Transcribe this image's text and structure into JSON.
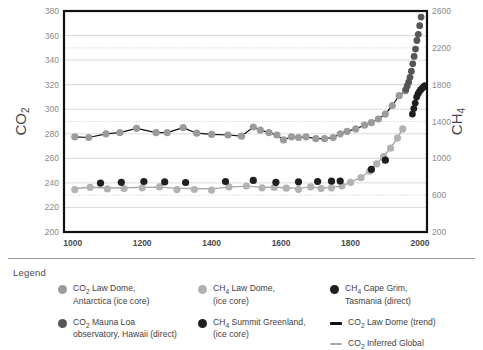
{
  "chart_data": {
    "type": "scatter",
    "title": "",
    "xlabel": "",
    "ylabel": "CO2",
    "y2label": "CH4",
    "xlim": [
      975,
      2020
    ],
    "ylim": [
      200,
      380
    ],
    "y2lim": [
      200,
      2600
    ],
    "grid": true,
    "legend_position": "below",
    "x_ticks": [
      1000,
      1200,
      1400,
      1600,
      1800,
      2000
    ],
    "y_ticks": [
      200,
      220,
      240,
      260,
      280,
      300,
      320,
      340,
      360,
      380
    ],
    "y2_ticks": [
      200,
      600,
      1000,
      1400,
      1800,
      2200,
      2600
    ],
    "series": [
      {
        "name": "CO2 Law Dome, Antarctica (ice core)",
        "axis": "left",
        "color": "#9b9b9b",
        "marker": "circle",
        "x": [
          1006,
          1046,
          1096,
          1136,
          1184,
          1240,
          1272,
          1318,
          1357,
          1400,
          1447,
          1486,
          1520,
          1540,
          1565,
          1588,
          1607,
          1630,
          1650,
          1672,
          1700,
          1725,
          1750,
          1770,
          1790,
          1815,
          1840,
          1860,
          1880,
          1900,
          1920,
          1940,
          1958
        ],
        "y": [
          277.5,
          277.0,
          280.0,
          281.0,
          284.5,
          281.0,
          281.0,
          285.0,
          280.5,
          279.5,
          279.0,
          278.0,
          285.5,
          283.0,
          281.0,
          279.0,
          275.0,
          277.5,
          277.0,
          277.5,
          276.0,
          276.0,
          277.0,
          280.0,
          282.0,
          284.0,
          287.0,
          289.0,
          292.0,
          296.0,
          303.0,
          311.0,
          315.0
        ]
      },
      {
        "name": "CO2 Mauna Loa observatory, Hawaii (direct)",
        "axis": "left",
        "color": "#565656",
        "marker": "circle",
        "x": [
          1959,
          1963,
          1967,
          1971,
          1975,
          1979,
          1983,
          1987,
          1991,
          1995,
          1999,
          2003,
          2007,
          2011,
          2014
        ],
        "y": [
          316,
          319,
          322,
          326,
          331,
          337,
          343,
          349,
          356,
          361,
          368,
          375,
          384,
          392,
          399
        ]
      },
      {
        "name": "CH4 Law Dome, (ice core)",
        "axis": "right",
        "color": "#b2b2b2",
        "marker": "circle",
        "x": [
          1006,
          1050,
          1100,
          1148,
          1200,
          1250,
          1300,
          1350,
          1400,
          1450,
          1500,
          1545,
          1580,
          1615,
          1650,
          1685,
          1715,
          1745,
          1775,
          1800,
          1830,
          1855,
          1875,
          1895,
          1915,
          1935,
          1950
        ],
        "y": [
          660,
          685,
          668,
          672,
          680,
          690,
          660,
          662,
          655,
          690,
          700,
          680,
          684,
          676,
          664,
          690,
          672,
          680,
          700,
          740,
          790,
          860,
          940,
          1020,
          1110,
          1220,
          1320
        ]
      },
      {
        "name": "CH4 Summit Greenland, (ice core)",
        "axis": "right",
        "color": "#1f1f1f",
        "marker": "circle",
        "x": [
          1080,
          1140,
          1205,
          1265,
          1325,
          1440,
          1520,
          1585,
          1650,
          1705,
          1745,
          1770,
          1860,
          1900
        ],
        "y": [
          730,
          740,
          748,
          744,
          738,
          748,
          760,
          740,
          745,
          748,
          752,
          754,
          880,
          980
        ]
      },
      {
        "name": "CH4 Cape Grim, Tasmania (direct)",
        "axis": "right",
        "color": "#1f1f1f",
        "marker": "circle",
        "x": [
          1978,
          1982,
          1986,
          1990,
          1994,
          1998,
          2002,
          2006,
          2010,
          2014
        ],
        "y": [
          1480,
          1540,
          1600,
          1665,
          1700,
          1725,
          1745,
          1760,
          1775,
          1790
        ]
      }
    ],
    "trend_lines": [
      {
        "name": "CO2 Law Dome (trend)",
        "axis": "left",
        "color": "#111111",
        "width": 1.2,
        "x": [
          1006,
          1046,
          1096,
          1136,
          1184,
          1240,
          1272,
          1318,
          1357,
          1400,
          1447,
          1486,
          1520,
          1540,
          1565,
          1588,
          1607,
          1630,
          1650,
          1672,
          1700,
          1725,
          1750,
          1770,
          1790,
          1815,
          1840,
          1860,
          1880,
          1900,
          1920,
          1940,
          1958
        ],
        "y": [
          277.5,
          277.0,
          280.0,
          281.0,
          284.5,
          281.0,
          281.0,
          285.0,
          280.5,
          279.5,
          279.0,
          278.0,
          285.5,
          283.0,
          281.0,
          279.0,
          275.0,
          277.5,
          277.0,
          277.5,
          276.0,
          276.0,
          277.0,
          280.0,
          282.0,
          284.0,
          287.0,
          289.0,
          292.0,
          296.0,
          303.0,
          311.0,
          315.0
        ]
      },
      {
        "name": "CO2 Inferred Global",
        "axis": "right",
        "color": "#a8a8a8",
        "width": 1.4,
        "x": [
          1006,
          1050,
          1100,
          1148,
          1200,
          1250,
          1300,
          1350,
          1400,
          1450,
          1500,
          1545,
          1580,
          1615,
          1650,
          1685,
          1715,
          1745,
          1775,
          1800,
          1830,
          1855,
          1875,
          1895,
          1915,
          1935,
          1950
        ],
        "y": [
          672,
          686,
          678,
          680,
          684,
          688,
          674,
          672,
          668,
          688,
          698,
          684,
          686,
          680,
          674,
          690,
          678,
          684,
          700,
          742,
          792,
          862,
          942,
          1022,
          1112,
          1222,
          1322
        ]
      }
    ]
  },
  "legend": {
    "title": "Legend",
    "columns": [
      [
        {
          "swatch": "dot",
          "color": "#9b9b9b",
          "label": "CO2 Law Dome,\nAntarctica (ice core)",
          "name": "legend-co2-law-dome"
        },
        {
          "swatch": "dot",
          "color": "#565656",
          "label": "CO2 Mauna Loa\nobservatory, Hawaii (direct)",
          "name": "legend-co2-mauna-loa"
        }
      ],
      [
        {
          "swatch": "dot",
          "color": "#b2b2b2",
          "label": "CH4 Law Dome,\n(ice core)",
          "name": "legend-ch4-law-dome"
        },
        {
          "swatch": "dot",
          "color": "#1f1f1f",
          "label": "CH4 Summit Greenland,\n(ice core)",
          "name": "legend-ch4-summit-greenland"
        }
      ],
      [
        {
          "swatch": "dot",
          "color": "#1f1f1f",
          "label": "CH4 Cape Grim,\nTasmania (direct)",
          "name": "legend-ch4-cape-grim"
        },
        {
          "swatch": "line",
          "color": "#111111",
          "label": "CO2 Law Dome (trend)",
          "name": "legend-co2-law-dome-trend"
        },
        {
          "swatch": "line-thin",
          "color": "#a8a8a8",
          "label": "CO2 Inferred Global",
          "name": "legend-co2-inferred-global"
        }
      ]
    ]
  },
  "colors": {
    "axis": "#111111",
    "gridline_left": "#d8d8d8",
    "gridline_right": "#e8c9c9",
    "tick_text": "#8a8a8a",
    "xtick_text": "#4a4a4a"
  }
}
